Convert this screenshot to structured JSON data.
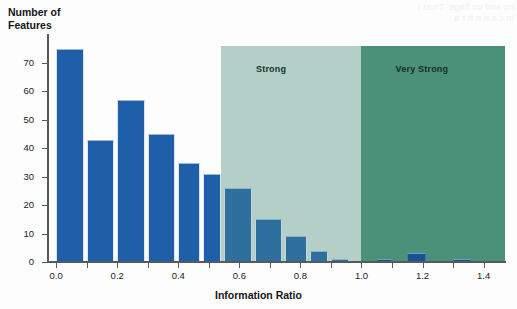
{
  "ghost": {
    "bleed_text": "nu and ou flags: Trust i\nm  c  s  e  n  h  r  a"
  },
  "chart_data": {
    "type": "bar",
    "title": "",
    "subtitle": "",
    "xlabel": "Information Ratio",
    "ylabel": "Number of\nFeatures",
    "xlim": [
      -0.03,
      1.47
    ],
    "ylim": [
      0,
      80
    ],
    "grid": false,
    "legend": "none",
    "bar_width": 0.05,
    "x": [
      0.025,
      0.125,
      0.225,
      0.325,
      0.425,
      0.505,
      0.575,
      0.675,
      0.775,
      0.855,
      0.925,
      1.075,
      1.175,
      1.325
    ],
    "bin_starts": [
      0.0,
      0.1,
      0.2,
      0.3,
      0.4,
      0.48,
      0.55,
      0.65,
      0.75,
      0.83,
      0.9,
      1.05,
      1.15,
      1.3
    ],
    "bin_ends": [
      0.09,
      0.19,
      0.29,
      0.39,
      0.47,
      0.54,
      0.64,
      0.74,
      0.82,
      0.89,
      0.96,
      1.1,
      1.21,
      1.36
    ],
    "values": [
      75,
      43,
      57,
      45,
      35,
      31,
      26,
      15,
      9,
      4,
      1,
      1,
      3,
      1
    ],
    "categories": [
      "0.0-0.1",
      "0.1-0.2",
      "0.2-0.3",
      "0.3-0.4",
      "0.4-0.47",
      "0.48-0.54",
      "0.55-0.64",
      "0.65-0.74",
      "0.75-0.82",
      "0.83-0.89",
      "0.9-0.96",
      "1.05-1.1",
      "1.15-1.21",
      "1.3-1.36"
    ],
    "yticks": [
      0,
      10,
      20,
      30,
      40,
      50,
      60,
      70
    ],
    "ytick_labels": [
      "0",
      "10",
      "20",
      "30",
      "40",
      "50",
      "60",
      "70"
    ],
    "xticks": [
      0.0,
      0.1,
      0.2,
      0.3,
      0.4,
      0.5,
      0.6,
      0.7,
      0.8,
      0.9,
      1.0,
      1.1,
      1.2,
      1.3,
      1.4
    ],
    "xtick_major": [
      0.0,
      0.2,
      0.4,
      0.6,
      0.8,
      1.0,
      1.2,
      1.4
    ],
    "xtick_labels": [
      "0.0",
      "0.2",
      "0.4",
      "0.6",
      "0.8",
      "1.0",
      "1.2",
      "1.4"
    ],
    "annotations": [
      {
        "label": "Strong",
        "x_start": 0.54,
        "x_end": 1.0,
        "y_top": 76,
        "color": "#b4cfc8",
        "label_x": 0.72
      },
      {
        "label": "Very Strong",
        "x_start": 1.0,
        "x_end": 1.47,
        "y_top": 76,
        "color": "#4b9079",
        "label_x": 1.2
      }
    ],
    "colors": {
      "bar": "#1f5fa9",
      "bar_on_light_region": "#2f6f9e",
      "bar_on_dark_region": "#1d4f92",
      "region_strong": "#b4cfc8",
      "region_very_strong": "#4b9079",
      "axis": "#555b5c",
      "text": "#1b1b1b",
      "background": "#fdfdfd"
    }
  }
}
